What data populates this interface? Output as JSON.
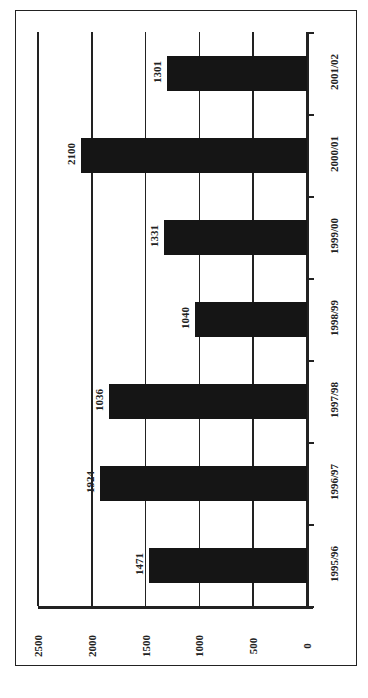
{
  "chart_data": {
    "type": "bar",
    "orientation": "rotated-90 (values grow leftward on page)",
    "title": "",
    "xlabel": "",
    "ylabel": "",
    "categories": [
      "1995/96",
      "1996/97",
      "1997/98",
      "1998/99",
      "1999/00",
      "2000/01",
      "2001/02"
    ],
    "values": [
      1471,
      1924,
      1836,
      1040,
      1331,
      2100,
      1301
    ],
    "data_labels": [
      "1471",
      "1924",
      "1036",
      "1040",
      "1331",
      "2100",
      "1301"
    ],
    "yticks": [
      "0",
      "500",
      "1000",
      "1500",
      "2000",
      "2500"
    ],
    "ylim": [
      0,
      2500
    ],
    "grid": true,
    "legend": null,
    "bar_color": "#151515"
  }
}
